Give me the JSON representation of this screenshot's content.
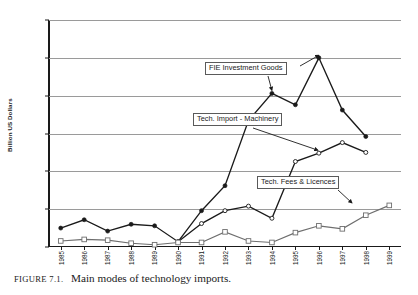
{
  "caption": {
    "figure_number": "FIGURE 7.1.",
    "title": "Main modes of technology imports."
  },
  "annotations": [
    {
      "name": "fie-investment-goods",
      "label": "FIE Investment Goods"
    },
    {
      "name": "tech-import-machinery",
      "label": "Tech. Import - Machinery"
    },
    {
      "name": "tech-fees-licences",
      "label": "Tech. Fees & Licences"
    }
  ],
  "chart_data": {
    "type": "line",
    "title": "Main modes of technology imports.",
    "xlabel": "",
    "ylabel": "Billion US Dollars",
    "ylim": [
      0,
      30
    ],
    "yticks": [
      0,
      5,
      10,
      15,
      20,
      25,
      30
    ],
    "ytick_labels": [
      "0",
      "5",
      "10",
      "15",
      "20",
      "25",
      "30"
    ],
    "grid": true,
    "legend": "annotated-callouts",
    "categories": [
      "1985",
      "1986",
      "1987",
      "1988",
      "1989",
      "1990",
      "1991",
      "1992",
      "1993",
      "1994",
      "1995",
      "1996",
      "1997",
      "1998",
      "1999"
    ],
    "series": [
      {
        "name": "FIE Investment Goods",
        "marker": "filled-circle",
        "color": "#1a1a1a",
        "values": [
          2.5,
          3.6,
          2.1,
          3.0,
          2.8,
          0.7,
          4.8,
          8.1,
          16.7,
          20.3,
          18.8,
          25.0,
          18.1,
          14.6,
          null
        ]
      },
      {
        "name": "Tech. Import - Machinery",
        "marker": "open-circle",
        "color": "#1a1a1a",
        "values": [
          null,
          null,
          null,
          null,
          null,
          0.7,
          3.1,
          4.8,
          5.4,
          3.8,
          11.3,
          12.4,
          13.8,
          12.5,
          null
        ]
      },
      {
        "name": "Tech. Fees & Licences",
        "marker": "open-square",
        "color": "#6e6e6e",
        "values": [
          0.8,
          1.0,
          0.9,
          0.5,
          0.3,
          0.6,
          0.6,
          2.0,
          0.8,
          0.6,
          1.9,
          2.8,
          2.4,
          4.2,
          5.5
        ]
      }
    ]
  }
}
